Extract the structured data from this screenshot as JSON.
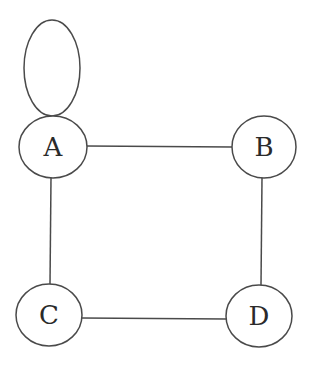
{
  "diagram": {
    "type": "undirected-graph",
    "colors": {
      "background": "#ffffff",
      "stroke": "#4a4a4a",
      "label": "#2a2a2a"
    },
    "nodes": [
      {
        "id": "A",
        "label": "A",
        "cx": 53,
        "cy": 147,
        "rx": 34,
        "ry": 31
      },
      {
        "id": "B",
        "label": "B",
        "cx": 264,
        "cy": 147,
        "rx": 32,
        "ry": 31
      },
      {
        "id": "C",
        "label": "C",
        "cx": 49,
        "cy": 315,
        "rx": 33,
        "ry": 31
      },
      {
        "id": "D",
        "label": "D",
        "cx": 259,
        "cy": 316,
        "rx": 33,
        "ry": 31
      }
    ],
    "edges": [
      {
        "from": "A",
        "to": "A",
        "kind": "self-loop"
      },
      {
        "from": "A",
        "to": "B"
      },
      {
        "from": "A",
        "to": "C"
      },
      {
        "from": "B",
        "to": "D"
      },
      {
        "from": "C",
        "to": "D"
      }
    ],
    "self_loop": {
      "node": "A",
      "cx": 52,
      "cy": 68,
      "rx": 28,
      "ry": 48
    }
  }
}
